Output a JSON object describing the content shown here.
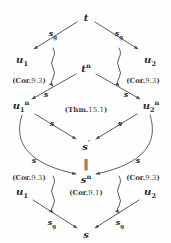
{
  "diagram": {
    "type": "commutative-diagram",
    "background_color": "#fefefe",
    "ink_color": "#2b2b2b",
    "nodes": [
      {
        "id": "t",
        "label": "t",
        "sup": "",
        "sub": "",
        "prime": false,
        "x": 86,
        "y": 18
      },
      {
        "id": "u1",
        "label": "u",
        "sup": "",
        "sub": "1",
        "prime": false,
        "x": 22,
        "y": 60
      },
      {
        "id": "u2",
        "label": "u",
        "sup": "",
        "sub": "2",
        "prime": false,
        "x": 150,
        "y": 60
      },
      {
        "id": "tn",
        "label": "t",
        "sup": "n",
        "sub": "",
        "prime": false,
        "x": 86,
        "y": 69
      },
      {
        "id": "u1n",
        "label": "u",
        "sup": "n",
        "sub": "1",
        "prime": false,
        "x": 21,
        "y": 106
      },
      {
        "id": "u2n",
        "label": "u",
        "sup": "n",
        "sub": "2",
        "prime": false,
        "x": 151,
        "y": 106
      },
      {
        "id": "sprime",
        "label": "s",
        "sup": "",
        "sub": "",
        "prime": true,
        "x": 86,
        "y": 145
      },
      {
        "id": "sn",
        "label": "s",
        "sup": "n",
        "sub": "",
        "prime": false,
        "x": 86,
        "y": 180
      },
      {
        "id": "u1b",
        "label": "u",
        "sup": "",
        "sub": "1",
        "prime": false,
        "x": 22,
        "y": 192
      },
      {
        "id": "u2b",
        "label": "u",
        "sup": "",
        "sub": "2",
        "prime": false,
        "x": 150,
        "y": 192
      },
      {
        "id": "s",
        "label": "s",
        "sup": "",
        "sub": "",
        "prime": false,
        "x": 86,
        "y": 235
      }
    ],
    "edge_labels": [
      {
        "id": "top-left-sg",
        "label": "s",
        "sub": "g",
        "x": 53,
        "y": 33
      },
      {
        "id": "top-right-sg",
        "label": "s",
        "sub": "g",
        "x": 119,
        "y": 33
      },
      {
        "id": "mid-left-s",
        "label": "s",
        "sub": "",
        "x": 46,
        "y": 94
      },
      {
        "id": "mid-right-s",
        "label": "s",
        "sub": "",
        "x": 126,
        "y": 94
      },
      {
        "id": "lower-left-s",
        "label": "s",
        "sub": "",
        "x": 52,
        "y": 123
      },
      {
        "id": "lower-right-s",
        "label": "s",
        "sub": "",
        "x": 120,
        "y": 123
      },
      {
        "id": "arc-left-s",
        "label": "s",
        "sub": "",
        "x": 34,
        "y": 160
      },
      {
        "id": "arc-right-s",
        "label": "s",
        "sub": "",
        "x": 138,
        "y": 160
      },
      {
        "id": "bottom-left-sg",
        "label": "s",
        "sub": "g",
        "x": 52,
        "y": 222
      },
      {
        "id": "bottom-right-sg",
        "label": "s",
        "sub": "g",
        "x": 120,
        "y": 222
      }
    ],
    "references": [
      {
        "id": "cor-93-top-left",
        "prefix": "(Cor.",
        "number": "9.3",
        "suffix": ")",
        "x": 29,
        "y": 81
      },
      {
        "id": "cor-93-top-right",
        "prefix": "(Cor.",
        "number": "9.3",
        "suffix": ")",
        "x": 143,
        "y": 81
      },
      {
        "id": "thm-151",
        "prefix": "(Thm.",
        "number": "15.1",
        "suffix": ")",
        "x": 86,
        "y": 110
      },
      {
        "id": "cor-93-bottom-left",
        "prefix": "(Cor.",
        "number": "9.3",
        "suffix": ")",
        "x": 29,
        "y": 178
      },
      {
        "id": "cor-93-bottom-right",
        "prefix": "(Cor.",
        "number": "9.3",
        "suffix": ")",
        "x": 143,
        "y": 178
      },
      {
        "id": "cor-91",
        "prefix": "(Cor.",
        "number": "9.1",
        "suffix": ")",
        "x": 86,
        "y": 193
      }
    ],
    "equality_marks": [
      {
        "id": "equals-sprime-sn",
        "symbol": "‖",
        "x": 86,
        "y": 163
      }
    ]
  }
}
